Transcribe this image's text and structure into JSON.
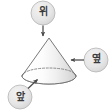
{
  "figure": {
    "title": "",
    "background_color": "#ffffff",
    "solid": {
      "name": "cone",
      "fill_color": "#fbfbfb",
      "shade_color": "#d9d9d9",
      "outline_color": "#6b6b6b",
      "hidden_edge_style": "dashed",
      "apex": {
        "x": 49,
        "y": 38
      },
      "base_center": {
        "x": 49,
        "y": 76
      },
      "base_radius_x": 27,
      "base_radius_y": 8
    },
    "callouts": [
      {
        "id": "top",
        "label": "위",
        "meaning": "top-view",
        "badge_color": "#e8e8e8",
        "badge_border_color": "#b4b4b4",
        "text_color": "#3a3a3a",
        "badge_center": {
          "x": 43,
          "y": 13
        },
        "badge_radius": 12,
        "arrow_direction": "down",
        "arrow_from": {
          "x": 43,
          "y": 25
        },
        "arrow_to": {
          "x": 43,
          "y": 36
        }
      },
      {
        "id": "side",
        "label": "옆",
        "meaning": "side-view",
        "badge_color": "#e8e8e8",
        "badge_border_color": "#b4b4b4",
        "text_color": "#3a3a3a",
        "badge_center": {
          "x": 96,
          "y": 60
        },
        "badge_radius": 12,
        "arrow_direction": "left",
        "arrow_from": {
          "x": 84,
          "y": 60
        },
        "arrow_to": {
          "x": 71,
          "y": 60
        }
      },
      {
        "id": "front",
        "label": "앞",
        "meaning": "front-view",
        "badge_color": "#e8e8e8",
        "badge_border_color": "#b4b4b4",
        "text_color": "#3a3a3a",
        "badge_center": {
          "x": 20,
          "y": 97
        },
        "badge_radius": 12,
        "arrow_direction": "up-right",
        "arrow_from": {
          "x": 28,
          "y": 88
        },
        "arrow_to": {
          "x": 38,
          "y": 79
        }
      }
    ],
    "arrow_color": "#4a4a4a"
  }
}
